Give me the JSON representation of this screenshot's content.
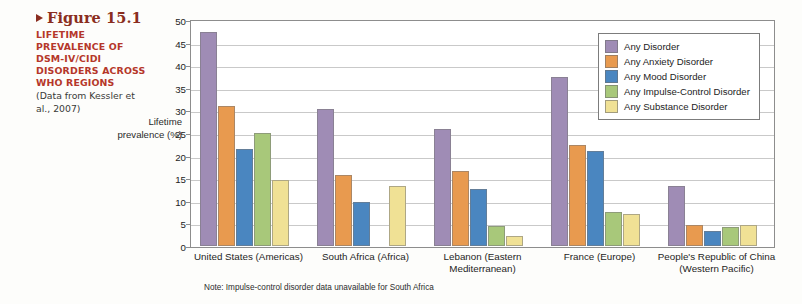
{
  "caption": {
    "figure_label": "Figure 15.1",
    "marker_icon": "triangle-right-icon",
    "headline": "LIFETIME PREVALENCE OF DSM-IV/CIDI DISORDERS ACROSS WHO REGIONS",
    "source": "(Data from Kessler et al., 2007)"
  },
  "colors": {
    "title": "#8a2d20",
    "headline": "#b5372a",
    "any_disorder": "#9f8cb5",
    "any_anxiety": "#e89a4f",
    "any_mood": "#4a86c0",
    "any_impulse": "#a8c87a",
    "any_substance": "#f0e195"
  },
  "legend": {
    "position": "top-right",
    "items": [
      {
        "label": "Any Disorder",
        "color": "#9f8cb5",
        "icon": "legend-swatch"
      },
      {
        "label": "Any Anxiety Disorder",
        "color": "#e89a4f",
        "icon": "legend-swatch"
      },
      {
        "label": "Any Mood Disorder",
        "color": "#4a86c0",
        "icon": "legend-swatch"
      },
      {
        "label": "Any Impulse-Control Disorder",
        "color": "#a8c87a",
        "icon": "legend-swatch"
      },
      {
        "label": "Any Substance Disorder",
        "color": "#f0e195",
        "icon": "legend-swatch"
      }
    ]
  },
  "note": "Note: Impulse-control disorder data unavailable for South Africa",
  "chart_data": {
    "type": "bar",
    "title": "",
    "xlabel": "",
    "ylabel": "Lifetime prevalence (%)",
    "ylim": [
      0,
      50
    ],
    "yticks": [
      0,
      5,
      10,
      15,
      20,
      25,
      30,
      35,
      40,
      45,
      50
    ],
    "grid": true,
    "legend_position": "top-right",
    "categories": [
      "United States (Americas)",
      "South Africa (Africa)",
      "Lebanon (Eastern Mediterranean)",
      "France (Europe)",
      "People's Republic of China (Western Pacific)"
    ],
    "category_lines": [
      [
        "United States (Americas)"
      ],
      [
        "South Africa (Africa)"
      ],
      [
        "Lebanon (Eastern",
        "Mediterranean)"
      ],
      [
        "France (Europe)"
      ],
      [
        "People's Republic of China",
        "(Western Pacific)"
      ]
    ],
    "series": [
      {
        "name": "Any Disorder",
        "color": "#9f8cb5",
        "values": [
          47.4,
          30.3,
          25.8,
          37.4,
          13.2
        ]
      },
      {
        "name": "Any Anxiety Disorder",
        "color": "#e89a4f",
        "values": [
          31.0,
          15.8,
          16.7,
          22.3,
          4.6
        ]
      },
      {
        "name": "Any Mood Disorder",
        "color": "#4a86c0",
        "values": [
          21.4,
          9.8,
          12.6,
          21.0,
          3.3
        ]
      },
      {
        "name": "Any Impulse-Control Disorder",
        "color": "#a8c87a",
        "values": [
          25.0,
          null,
          4.4,
          7.6,
          4.3
        ]
      },
      {
        "name": "Any Substance Disorder",
        "color": "#f0e195",
        "values": [
          14.6,
          13.3,
          2.2,
          7.0,
          4.7
        ]
      }
    ]
  }
}
